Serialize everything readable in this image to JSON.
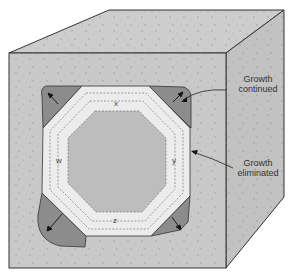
{
  "diagram": {
    "annotations": {
      "growth_continued": [
        "Growth",
        "continued"
      ],
      "growth_eliminated": [
        "Growth",
        "eliminated"
      ]
    },
    "face_labels": {
      "top": "x",
      "right": "y",
      "bottom": "z",
      "left": "w"
    },
    "colors": {
      "matrix": "#c9c9c9",
      "matrix_top": "#cdcdcd",
      "matrix_side": "#c2c2c2",
      "crystal_band": "#ececec",
      "crystal_core": "#bdbdbd",
      "corner_growth": "#8a8a8a",
      "outline": "#333333"
    }
  }
}
